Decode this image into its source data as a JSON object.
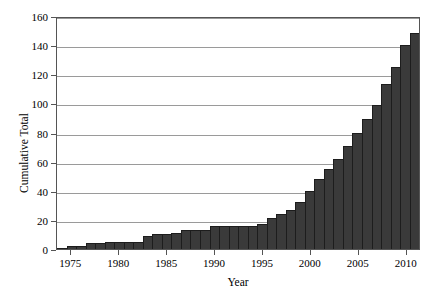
{
  "chart_data": {
    "type": "bar",
    "title": "",
    "subtitle": "",
    "xlabel": "Year",
    "ylabel": "Cumulative Total",
    "xlim": [
      1973.5,
      2011.5
    ],
    "ylim": [
      0,
      160
    ],
    "grid": true,
    "legend": null,
    "bar_color": "#3a3a3a",
    "bar_edge_color": "#1d1d1d",
    "background_color": "#ffffff",
    "gridline_color": "#9a9a9a",
    "axis_color": "#555555",
    "ytick_labels": [
      "0",
      "20",
      "40",
      "60",
      "80",
      "100",
      "120",
      "140",
      "160"
    ],
    "ytick_values": [
      0,
      20,
      40,
      60,
      80,
      100,
      120,
      140,
      160
    ],
    "xtick_labels": [
      "1975",
      "1980",
      "1985",
      "1990",
      "1995",
      "2000",
      "2005",
      "2010"
    ],
    "xtick_values": [
      1975,
      1980,
      1985,
      1990,
      1995,
      2000,
      2005,
      2010
    ],
    "categories": [
      1974,
      1975,
      1976,
      1977,
      1978,
      1979,
      1980,
      1981,
      1982,
      1983,
      1984,
      1985,
      1986,
      1987,
      1988,
      1989,
      1990,
      1991,
      1992,
      1993,
      1994,
      1995,
      1996,
      1997,
      1998,
      1999,
      2000,
      2001,
      2002,
      2003,
      2004,
      2005,
      2006,
      2007,
      2008,
      2009,
      2010,
      2011
    ],
    "values": [
      1,
      2,
      2,
      4,
      4,
      5,
      5,
      5,
      5,
      9,
      10,
      10,
      11,
      13,
      13,
      13,
      16,
      16,
      16,
      16,
      16,
      17,
      21,
      24,
      27,
      32,
      40,
      48,
      55,
      62,
      71,
      80,
      89,
      99,
      113,
      125,
      140,
      148
    ],
    "values_label": "Cumulative Total"
  }
}
